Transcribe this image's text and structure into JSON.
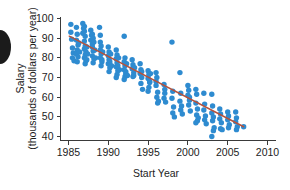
{
  "chart_data": {
    "type": "scatter",
    "title": "",
    "xlabel": "Start Year",
    "ylabel_line1": "Salary",
    "ylabel_line2": "(thousands of dollars per year)",
    "xlim": [
      1984,
      2011
    ],
    "ylim": [
      38,
      101
    ],
    "xticks": [
      1985,
      1990,
      1995,
      2000,
      2005,
      2010
    ],
    "xtick_labels": [
      "1985",
      "1990",
      "1995",
      "2000",
      "2005",
      "2010"
    ],
    "yticks": [
      40,
      50,
      60,
      70,
      80,
      90,
      100
    ],
    "ytick_labels": [
      "40",
      "50",
      "60",
      "70",
      "80",
      "90",
      "100"
    ],
    "grid": false,
    "legend": "none",
    "marker_color": "#2E8BD0",
    "trendline_color": "#B5523C",
    "axis_color": "#3A3A3A",
    "marker_size": 3.6,
    "trendline": {
      "x": [
        1985.1,
        2007.0
      ],
      "y": [
        91.0,
        45.0
      ],
      "slope": -2.1,
      "intercept_year": 1985.1,
      "intercept_value": 91.0
    },
    "points": [
      [
        1985.3,
        97.0
      ],
      [
        1985.4,
        89.5
      ],
      [
        1985.5,
        85.0
      ],
      [
        1985.6,
        82.5
      ],
      [
        1985.5,
        80.0
      ],
      [
        1985.7,
        78.5
      ],
      [
        1985.3,
        93.0
      ],
      [
        1986.0,
        95.5
      ],
      [
        1986.1,
        92.0
      ],
      [
        1986.0,
        89.0
      ],
      [
        1986.2,
        86.5
      ],
      [
        1986.1,
        84.0
      ],
      [
        1986.0,
        82.0
      ],
      [
        1986.2,
        80.5
      ],
      [
        1986.1,
        78.0
      ],
      [
        1986.3,
        87.5
      ],
      [
        1986.4,
        83.0
      ],
      [
        1986.8,
        97.5
      ],
      [
        1986.9,
        95.0
      ],
      [
        1986.8,
        92.5
      ],
      [
        1287.0,
        90.0
      ],
      [
        1987.0,
        96.0
      ],
      [
        1987.0,
        93.5
      ],
      [
        1987.1,
        91.0
      ],
      [
        1987.0,
        88.5
      ],
      [
        1987.1,
        86.0
      ],
      [
        1987.0,
        84.5
      ],
      [
        1987.2,
        83.0
      ],
      [
        1987.1,
        81.5
      ],
      [
        1987.0,
        80.0
      ],
      [
        1987.2,
        78.5
      ],
      [
        1987.1,
        77.0
      ],
      [
        1987.3,
        85.5
      ],
      [
        1987.4,
        82.0
      ],
      [
        1987.3,
        79.0
      ],
      [
        1987.8,
        94.0
      ],
      [
        1987.9,
        91.5
      ],
      [
        1987.8,
        89.0
      ],
      [
        1988.0,
        87.0
      ],
      [
        1988.0,
        92.0
      ],
      [
        1988.1,
        90.0
      ],
      [
        1988.0,
        85.5
      ],
      [
        1988.1,
        83.5
      ],
      [
        1988.0,
        81.0
      ],
      [
        1988.2,
        79.5
      ],
      [
        1988.1,
        77.5
      ],
      [
        1988.2,
        88.0
      ],
      [
        1988.3,
        84.0
      ],
      [
        1988.4,
        80.0
      ],
      [
        1988.9,
        95.5
      ],
      [
        1989.0,
        91.5
      ],
      [
        1989.0,
        88.0
      ],
      [
        1989.1,
        86.0
      ],
      [
        1989.0,
        84.0
      ],
      [
        1989.1,
        82.0
      ],
      [
        1989.0,
        80.0
      ],
      [
        1989.2,
        78.0
      ],
      [
        1989.1,
        76.0
      ],
      [
        1989.3,
        83.0
      ],
      [
        1989.2,
        79.0
      ],
      [
        1990.0,
        85.5
      ],
      [
        1990.1,
        83.0
      ],
      [
        1990.0,
        81.0
      ],
      [
        1990.1,
        79.0
      ],
      [
        1990.0,
        77.0
      ],
      [
        1990.2,
        75.0
      ],
      [
        1990.1,
        73.0
      ],
      [
        1990.3,
        82.0
      ],
      [
        1990.2,
        78.0
      ],
      [
        1990.4,
        76.0
      ],
      [
        1991.0,
        84.0
      ],
      [
        1991.1,
        81.5
      ],
      [
        1991.0,
        79.5
      ],
      [
        1991.1,
        77.5
      ],
      [
        1991.0,
        75.5
      ],
      [
        1991.2,
        73.5
      ],
      [
        1991.1,
        71.5
      ],
      [
        1991.3,
        80.0
      ],
      [
        1991.2,
        76.0
      ],
      [
        1991.4,
        74.0
      ],
      [
        1991.0,
        70.0
      ],
      [
        1992.0,
        91.0
      ],
      [
        1992.1,
        80.0
      ],
      [
        1992.0,
        78.0
      ],
      [
        1992.1,
        76.0
      ],
      [
        1992.0,
        74.0
      ],
      [
        1992.2,
        72.0
      ],
      [
        1992.1,
        70.5
      ],
      [
        1992.3,
        77.0
      ],
      [
        1992.2,
        73.0
      ],
      [
        1992.4,
        71.0
      ],
      [
        1992.0,
        69.0
      ],
      [
        1993.0,
        79.0
      ],
      [
        1993.1,
        76.5
      ],
      [
        1993.0,
        74.5
      ],
      [
        1993.2,
        72.5
      ],
      [
        1993.1,
        70.5
      ],
      [
        1993.3,
        75.0
      ],
      [
        1993.2,
        71.0
      ],
      [
        1994.0,
        77.0
      ],
      [
        1994.1,
        74.0
      ],
      [
        1994.0,
        72.0
      ],
      [
        1994.2,
        70.0
      ],
      [
        1994.1,
        67.0
      ],
      [
        1994.3,
        64.0
      ],
      [
        1994.2,
        73.0
      ],
      [
        1995.0,
        73.5
      ],
      [
        1995.1,
        71.5
      ],
      [
        1995.0,
        69.5
      ],
      [
        1995.2,
        67.5
      ],
      [
        1995.1,
        65.0
      ],
      [
        1995.3,
        72.0
      ],
      [
        1995.2,
        68.0
      ],
      [
        1995.0,
        63.0
      ],
      [
        1996.0,
        72.5
      ],
      [
        1996.1,
        70.0
      ],
      [
        1996.0,
        66.0
      ],
      [
        1996.2,
        62.5
      ],
      [
        1996.1,
        60.0
      ],
      [
        1996.3,
        58.0
      ],
      [
        1996.2,
        57.0
      ],
      [
        1996.0,
        68.0
      ],
      [
        1997.0,
        66.5
      ],
      [
        1997.1,
        62.0
      ],
      [
        1997.0,
        59.5
      ],
      [
        1997.2,
        57.5
      ],
      [
        1997.1,
        64.0
      ],
      [
        1998.0,
        88.0
      ],
      [
        1998.1,
        63.0
      ],
      [
        1998.0,
        59.5
      ],
      [
        1998.2,
        55.0
      ],
      [
        1998.1,
        52.0
      ],
      [
        1998.3,
        50.0
      ],
      [
        1999.0,
        72.5
      ],
      [
        1999.1,
        62.0
      ],
      [
        1999.0,
        58.0
      ],
      [
        1999.2,
        55.5
      ],
      [
        1999.1,
        53.5
      ],
      [
        1999.3,
        51.5
      ],
      [
        2000.0,
        66.0
      ],
      [
        2000.1,
        63.5
      ],
      [
        2000.0,
        61.0
      ],
      [
        2000.2,
        58.5
      ],
      [
        2000.1,
        56.0
      ],
      [
        2000.3,
        53.0
      ],
      [
        2000.2,
        60.0
      ],
      [
        2001.0,
        64.0
      ],
      [
        2001.1,
        61.5
      ],
      [
        2001.0,
        57.0
      ],
      [
        2001.2,
        54.0
      ],
      [
        2001.1,
        51.0
      ],
      [
        2001.3,
        49.5
      ],
      [
        2001.2,
        48.0
      ],
      [
        2001.0,
        47.0
      ],
      [
        2002.0,
        62.0
      ],
      [
        2002.1,
        56.5
      ],
      [
        2002.0,
        53.5
      ],
      [
        2002.2,
        50.5
      ],
      [
        2002.1,
        48.5
      ],
      [
        2002.3,
        46.5
      ],
      [
        2003.0,
        61.5
      ],
      [
        2003.1,
        55.5
      ],
      [
        2003.0,
        52.0
      ],
      [
        2003.2,
        50.0
      ],
      [
        2003.1,
        48.0
      ],
      [
        2003.3,
        44.5
      ],
      [
        2003.2,
        43.0
      ],
      [
        2003.0,
        40.0
      ],
      [
        2004.0,
        54.0
      ],
      [
        2004.1,
        51.5
      ],
      [
        2004.0,
        49.0
      ],
      [
        2004.2,
        47.0
      ],
      [
        2004.1,
        44.0
      ],
      [
        2004.3,
        43.5
      ],
      [
        2005.0,
        52.5
      ],
      [
        2005.1,
        50.5
      ],
      [
        2005.0,
        48.5
      ],
      [
        2005.2,
        46.0
      ],
      [
        2005.1,
        44.5
      ],
      [
        2006.0,
        52.5
      ],
      [
        2006.1,
        49.5
      ],
      [
        2006.0,
        47.5
      ],
      [
        2006.2,
        45.0
      ],
      [
        2006.1,
        43.5
      ],
      [
        2007.0,
        45.0
      ]
    ]
  }
}
